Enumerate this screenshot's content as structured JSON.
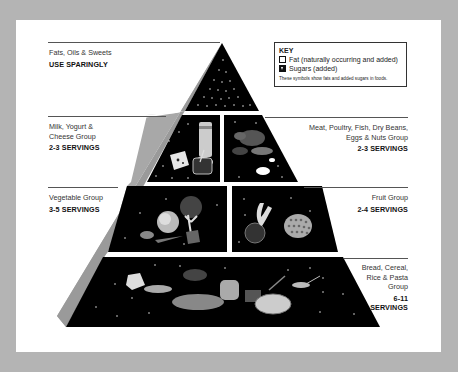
{
  "key": {
    "title": "KEY",
    "items": [
      {
        "symbol": "open-square",
        "label": "Fat (naturally occurring and added)"
      },
      {
        "symbol": "filled-triangle-square",
        "label": "Sugars (added)"
      }
    ],
    "note": "These symbols show fats and added sugars in foods."
  },
  "groups": {
    "fats": {
      "name": "Fats, Oils & Sweets",
      "servings": "USE SPARINGLY"
    },
    "milk": {
      "name_line1": "Milk, Yogurt &",
      "name_line2": "Cheese Group",
      "servings": "2-3 SERVINGS"
    },
    "meat": {
      "name_line1": "Meat, Poultry, Fish, Dry Beans,",
      "name_line2": "Eggs & Nuts Group",
      "servings": "2-3 SERVINGS"
    },
    "vegetable": {
      "name": "Vegetable Group",
      "servings": "3-5 SERVINGS"
    },
    "fruit": {
      "name": "Fruit Group",
      "servings": "2-4 SERVINGS"
    },
    "bread": {
      "name_line1": "Bread, Cereal,",
      "name_line2": "Rice & Pasta",
      "name_line3": "Group",
      "servings_line1": "6-11",
      "servings_line2": "SERVINGS"
    }
  },
  "colors": {
    "background": "#b4b4b4",
    "card": "#ffffff",
    "tier_fill": "#000000",
    "side_face": "#a8a8a8",
    "text": "#333333"
  }
}
